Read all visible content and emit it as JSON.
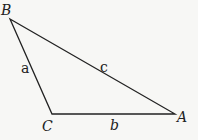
{
  "diagram": {
    "type": "triangle",
    "vertices": [
      {
        "name": "B",
        "x": 10,
        "y": 19
      },
      {
        "name": "C",
        "x": 52,
        "y": 114
      },
      {
        "name": "A",
        "x": 175,
        "y": 114
      }
    ],
    "vertex_labels": {
      "A": "A",
      "B": "B",
      "C": "C"
    },
    "side_labels": {
      "a": "a",
      "b": "b",
      "c": "c"
    },
    "stroke_color": "#222222",
    "background": "#f7f7f5"
  }
}
